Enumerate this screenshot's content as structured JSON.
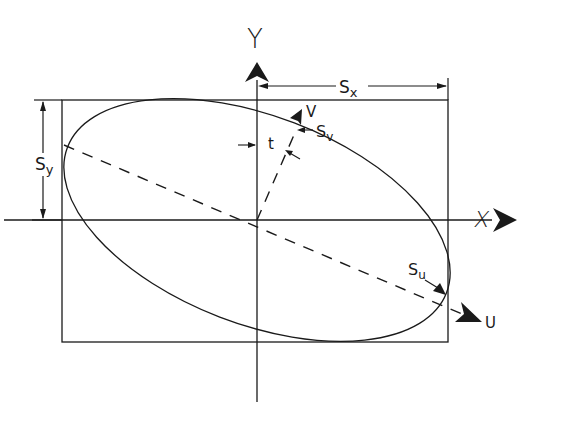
{
  "diagram": {
    "type": "error-ellipse-geometry",
    "axes": {
      "y_label": "Y",
      "x_label": "X",
      "u_label": "U",
      "v_label": "V"
    },
    "dimensions": {
      "sx_label": "S",
      "sx_sub": "x",
      "sy_label": "S",
      "sy_sub": "y",
      "su_label": "S",
      "su_sub": "u",
      "sv_label": "S",
      "sv_sub": "v",
      "t_label": "t"
    },
    "colors": {
      "ink": "#1a1a1a",
      "background": "#ffffff"
    }
  }
}
